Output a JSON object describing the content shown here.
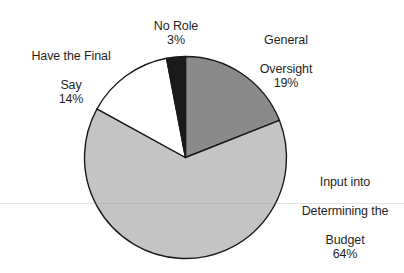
{
  "chart_data": {
    "type": "pie",
    "title": "",
    "subtitle": "",
    "xlabel": "",
    "ylabel": "",
    "legend_position": "none",
    "grid": false,
    "labels_show_percent": true,
    "start_angle_deg": 0,
    "direction": "clockwise",
    "categories": [
      "General Oversight",
      "Input into Determining the Budget",
      "Have the Final Say",
      "No Role"
    ],
    "values": [
      19,
      64,
      14,
      3
    ],
    "units": "%",
    "colors": [
      "#8a8a8a",
      "#c4c4c4",
      "#ffffff",
      "#1a1a1a"
    ],
    "stroke_color": "#1a1a1a",
    "slices": [
      {
        "name": "General Oversight",
        "label_line1": "General",
        "label_line2": "Oversight",
        "value": 19,
        "percent_text": "19%",
        "color": "#8a8a8a",
        "start_deg": 0,
        "end_deg": 68.4
      },
      {
        "name": "Input into Determining the Budget",
        "label_line1": "Input into",
        "label_line2": "Determining the",
        "label_line3": "Budget",
        "value": 64,
        "percent_text": "64%",
        "color": "#c4c4c4",
        "start_deg": 68.4,
        "end_deg": 298.8
      },
      {
        "name": "Have the Final Say",
        "label_line1": "Have the Final",
        "label_line2": "Say",
        "value": 14,
        "percent_text": "14%",
        "color": "#ffffff",
        "start_deg": 298.8,
        "end_deg": 349.2
      },
      {
        "name": "No Role",
        "label_line1": "No Role",
        "value": 3,
        "percent_text": "3%",
        "color": "#1a1a1a",
        "start_deg": 349.2,
        "end_deg": 360
      }
    ]
  },
  "labels": {
    "no_role": {
      "line1": "No Role",
      "percent": "3%"
    },
    "general_oversight": {
      "line1": "General",
      "line2": "Oversight",
      "percent": "19%"
    },
    "final_say": {
      "line1": "Have the Final",
      "line2": "Say",
      "percent": "14%"
    },
    "budget": {
      "line1": "Input into",
      "line2": "Determining the",
      "line3": "Budget",
      "percent": "64%"
    }
  }
}
